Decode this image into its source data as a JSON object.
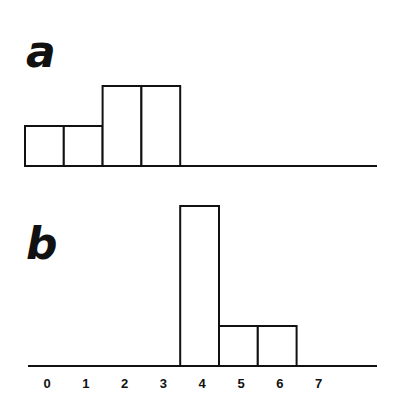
{
  "chart_data": [
    {
      "type": "bar",
      "panel": "a",
      "title": "a",
      "categories": [
        "0",
        "1",
        "2",
        "3",
        "4",
        "5",
        "6",
        "7"
      ],
      "values": [
        1,
        1,
        2,
        2,
        0,
        0,
        0,
        0
      ],
      "xlabel": "",
      "ylabel": "",
      "grid": false,
      "legend": null
    },
    {
      "type": "bar",
      "panel": "b",
      "title": "b",
      "categories": [
        "0",
        "1",
        "2",
        "3",
        "4",
        "5",
        "6",
        "7"
      ],
      "values": [
        0,
        0,
        0,
        0,
        4,
        1,
        1,
        0
      ],
      "xlabel": "",
      "ylabel": "",
      "grid": false,
      "legend": null
    }
  ],
  "panels": {
    "a": {
      "label": "a"
    },
    "b": {
      "label": "b"
    }
  },
  "x_ticks": [
    "0",
    "1",
    "2",
    "3",
    "4",
    "5",
    "6",
    "7"
  ],
  "colors": {
    "stroke": "#111111",
    "fill": "#ffffff"
  }
}
